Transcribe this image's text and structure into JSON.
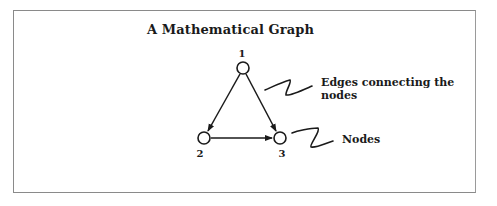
{
  "diagram": {
    "title": "A Mathematical Graph",
    "nodes": [
      {
        "id": "1",
        "label": "1",
        "cx": 243,
        "cy": 68
      },
      {
        "id": "2",
        "label": "2",
        "cx": 204,
        "cy": 138
      },
      {
        "id": "3",
        "label": "3",
        "cx": 280,
        "cy": 138
      }
    ],
    "edges": [
      {
        "from": "1",
        "to": "2",
        "directed": true
      },
      {
        "from": "1",
        "to": "3",
        "directed": true
      },
      {
        "from": "2",
        "to": "3",
        "directed": true
      }
    ],
    "annotations": {
      "edges_label_line1": "Edges connecting the",
      "edges_label_line2": "nodes",
      "nodes_label": "Nodes"
    },
    "colors": {
      "ink": "#1a1a1a",
      "frame": "#8a8a8a",
      "background": "#ffffff"
    }
  }
}
